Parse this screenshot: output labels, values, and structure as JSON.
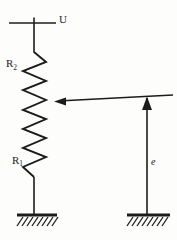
{
  "diagram": {
    "kind": "voltage-divider-circuit",
    "labels": {
      "supply_voltage": "U",
      "resistor_top": {
        "symbol": "R",
        "subscript": "2"
      },
      "resistor_bottom": {
        "symbol": "R",
        "subscript": "1"
      },
      "tap_voltage": "e"
    },
    "colors": {
      "ink": "#1c1c1c",
      "paper": "#fdfdfc"
    }
  }
}
